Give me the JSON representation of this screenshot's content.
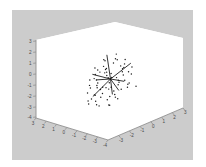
{
  "figure": {
    "background_color": "#cccccc",
    "panel_color": "#ffffff",
    "outer_color": "#ffffff",
    "axis_line_color": "#8f8f8f",
    "tick_label_color": "#4a4a4a",
    "point_color": "#1a1a1a",
    "vector_color": "#111111"
  },
  "chart_data": {
    "type": "scatter",
    "projection": "3d",
    "title": "",
    "xlabel": "",
    "ylabel": "",
    "zlabel": "",
    "grid": false,
    "legend": null,
    "xlim": [
      -4,
      3
    ],
    "ylim": [
      -4,
      3
    ],
    "zlim": [
      -4,
      3
    ],
    "xticks": [
      -4,
      -3,
      -2,
      -1,
      0,
      1,
      2,
      3
    ],
    "yticks": [
      -4,
      -3,
      -2,
      -1,
      0,
      1,
      2,
      3
    ],
    "zticks": [
      -4,
      -3,
      -2,
      -1,
      0,
      1,
      2,
      3
    ],
    "xticklabels": [
      "-4",
      "-3",
      "-2",
      "-1",
      "0",
      "1",
      "2",
      "3"
    ],
    "yticklabels": [
      "-4",
      "-3",
      "-2",
      "-1",
      "0",
      "1",
      "2",
      "3"
    ],
    "zticklabels": [
      "3",
      "2",
      "1",
      "0",
      "-1",
      "-2",
      "-3",
      "-4"
    ],
    "series": [
      {
        "name": "points",
        "marker": "dot",
        "color": "#1a1a1a",
        "points": [
          [
            -0.2,
            0.35,
            2.05
          ],
          [
            0.55,
            -0.1,
            1.95
          ],
          [
            0.95,
            0.4,
            1.75
          ],
          [
            -0.55,
            0.1,
            1.55
          ],
          [
            0.3,
            0.75,
            1.6
          ],
          [
            1.25,
            -0.25,
            1.45
          ],
          [
            0.1,
            -0.55,
            1.4
          ],
          [
            -0.85,
            0.55,
            1.3
          ],
          [
            0.7,
            0.95,
            1.25
          ],
          [
            1.45,
            0.2,
            1.15
          ],
          [
            -0.35,
            -0.8,
            1.1
          ],
          [
            0.45,
            0.05,
            1.05
          ],
          [
            -1.1,
            0.25,
            0.95
          ],
          [
            0.85,
            -0.6,
            0.9
          ],
          [
            1.6,
            0.55,
            0.85
          ],
          [
            -0.05,
            0.9,
            0.8
          ],
          [
            0.25,
            -0.3,
            0.75
          ],
          [
            -1.45,
            -0.15,
            0.7
          ],
          [
            1.05,
            0.65,
            0.65
          ],
          [
            0.6,
            -0.95,
            0.6
          ],
          [
            -0.7,
            0.45,
            0.55
          ],
          [
            1.8,
            -0.2,
            0.5
          ],
          [
            0.15,
            0.2,
            0.45
          ],
          [
            -1.25,
            0.8,
            0.4
          ],
          [
            0.9,
            -0.45,
            0.35
          ],
          [
            1.35,
            0.95,
            0.3
          ],
          [
            -0.45,
            -0.65,
            0.25
          ],
          [
            0.05,
            1.15,
            0.2
          ],
          [
            -1.7,
            0.05,
            0.15
          ],
          [
            1.15,
            -0.85,
            0.1
          ],
          [
            0.4,
            0.5,
            0.05
          ],
          [
            -0.95,
            -0.35,
            0.0
          ],
          [
            1.55,
            0.3,
            -0.05
          ],
          [
            -0.25,
            0.95,
            -0.1
          ],
          [
            0.75,
            -0.55,
            -0.15
          ],
          [
            -1.4,
            0.6,
            -0.2
          ],
          [
            1.9,
            -0.05,
            -0.25
          ],
          [
            0.2,
            -1.05,
            -0.3
          ],
          [
            -0.6,
            0.15,
            -0.35
          ],
          [
            1.0,
            0.85,
            -0.4
          ],
          [
            -1.85,
            -0.45,
            -0.45
          ],
          [
            0.5,
            -0.25,
            -0.5
          ],
          [
            1.45,
            -0.75,
            -0.55
          ],
          [
            -0.15,
            0.65,
            -0.6
          ],
          [
            -1.05,
            -0.95,
            -0.65
          ],
          [
            0.8,
            0.35,
            -0.7
          ],
          [
            1.7,
            0.7,
            -0.75
          ],
          [
            -0.4,
            -0.55,
            -0.8
          ],
          [
            0.35,
            1.05,
            -0.85
          ],
          [
            -1.55,
            0.25,
            -0.9
          ],
          [
            1.2,
            -0.35,
            -0.95
          ],
          [
            0.0,
            -0.75,
            -1.0
          ],
          [
            -0.8,
            0.85,
            -1.05
          ],
          [
            1.95,
            0.45,
            -1.1
          ],
          [
            0.65,
            -1.15,
            -1.15
          ],
          [
            -1.3,
            -0.25,
            -1.2
          ],
          [
            0.25,
            0.55,
            -1.25
          ],
          [
            1.5,
            -0.65,
            -1.3
          ],
          [
            -0.5,
            1.1,
            -1.35
          ],
          [
            1.1,
            0.15,
            -1.4
          ],
          [
            -1.75,
            0.7,
            -1.45
          ],
          [
            0.45,
            -0.95,
            -1.5
          ],
          [
            -0.1,
            0.3,
            -1.55
          ],
          [
            1.65,
            -0.45,
            -1.6
          ],
          [
            0.85,
            0.75,
            -1.65
          ],
          [
            -1.15,
            -0.65,
            -1.7
          ],
          [
            0.05,
            -1.25,
            -1.8
          ],
          [
            1.3,
            0.95,
            -1.9
          ],
          [
            -0.65,
            0.05,
            -2.0
          ],
          [
            0.95,
            -0.15,
            -2.1
          ],
          [
            -0.3,
            -0.45,
            -2.25
          ],
          [
            0.55,
            0.45,
            -2.4
          ]
        ]
      },
      {
        "name": "vectors",
        "type": "quiver",
        "color": "#111111",
        "origin": [
          0.0,
          0.0,
          0.0
        ],
        "arrows": [
          [
            0.25,
            -0.1,
            2.3
          ],
          [
            1.9,
            0.5,
            0.25
          ],
          [
            -1.7,
            -0.35,
            -0.55
          ],
          [
            -0.55,
            0.25,
            -1.3
          ],
          [
            1.25,
            -0.45,
            -1.05
          ],
          [
            -1.35,
            0.6,
            0.8
          ],
          [
            0.7,
            0.85,
            -1.55
          ],
          [
            1.55,
            -0.2,
            0.95
          ]
        ]
      }
    ]
  }
}
